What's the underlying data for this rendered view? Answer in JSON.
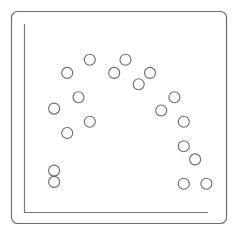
{
  "chart_data": {
    "type": "scatter",
    "title": "",
    "xlabel": "",
    "ylabel": "",
    "grid": false,
    "legend": null,
    "xlim": [
      0,
      100
    ],
    "ylim": [
      0,
      100
    ],
    "points": [
      {
        "x": 16,
        "y": 55
      },
      {
        "x": 23,
        "y": 74
      },
      {
        "x": 35,
        "y": 81
      },
      {
        "x": 29,
        "y": 61
      },
      {
        "x": 23,
        "y": 42
      },
      {
        "x": 35,
        "y": 48
      },
      {
        "x": 48,
        "y": 74
      },
      {
        "x": 54,
        "y": 81
      },
      {
        "x": 61,
        "y": 68
      },
      {
        "x": 67,
        "y": 74
      },
      {
        "x": 73,
        "y": 54
      },
      {
        "x": 80,
        "y": 61
      },
      {
        "x": 85,
        "y": 48
      },
      {
        "x": 85,
        "y": 35
      },
      {
        "x": 91,
        "y": 28
      },
      {
        "x": 16,
        "y": 22
      },
      {
        "x": 16,
        "y": 16
      },
      {
        "x": 85,
        "y": 15
      },
      {
        "x": 97,
        "y": 15
      }
    ]
  },
  "style": {
    "frame_color": "#6e6e6e",
    "axis_color": "#7a7a7a",
    "marker_stroke": "#6a6a6a",
    "marker_radius": 5.5
  }
}
